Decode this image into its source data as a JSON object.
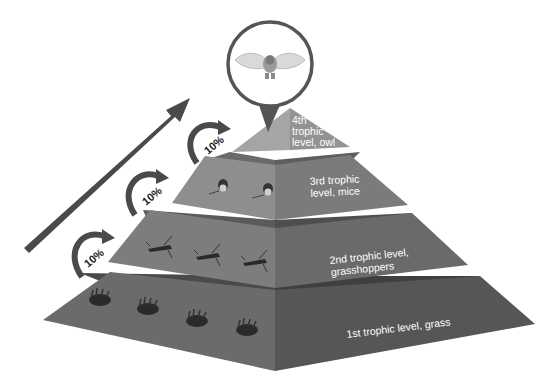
{
  "diagram": {
    "energy_arrow": {
      "label": "Decreasing energy",
      "color": "#4a4a4a"
    },
    "transfer_arrows": [
      {
        "label": "10%",
        "from": "1st trophic level",
        "to": "2nd trophic level"
      },
      {
        "label": "10%",
        "from": "2nd trophic level",
        "to": "3rd trophic level"
      },
      {
        "label": "10%",
        "from": "3rd trophic level",
        "to": "4th trophic level"
      }
    ],
    "levels": [
      {
        "id": "level-1",
        "label_lines": [
          "1st trophic level, grass"
        ],
        "organism": "grass",
        "count": 4,
        "colors": {
          "left": "#6b6b6b",
          "right": "#575757",
          "top": "#4a4a4a"
        }
      },
      {
        "id": "level-2",
        "label_lines": [
          "2nd trophic level,",
          "grasshoppers"
        ],
        "organism": "grasshopper",
        "count": 3,
        "colors": {
          "left": "#7d7d7d",
          "right": "#6a6a6a",
          "top": "#5a5a5a"
        }
      },
      {
        "id": "level-3",
        "label_lines": [
          "3rd trophic",
          "level, mice"
        ],
        "organism": "mouse",
        "count": 2,
        "colors": {
          "left": "#8e8e8e",
          "right": "#7b7b7b",
          "top": "#6a6a6a"
        }
      },
      {
        "id": "level-4",
        "label_lines": [
          "4th",
          "trophic",
          "level, owl"
        ],
        "organism": "owl",
        "count": 1,
        "colors": {
          "left": "#a5a5a5",
          "right": "#939393"
        }
      }
    ],
    "callout": {
      "organism": "owl",
      "border_color": "#555555"
    }
  }
}
